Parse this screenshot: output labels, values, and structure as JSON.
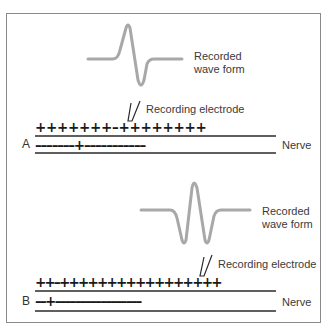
{
  "panels": [
    {
      "id": "A",
      "label": "A",
      "waveform_label_line1": "Recorded",
      "waveform_label_line2": "wave form",
      "electrode_label": "Recording electrode",
      "nerve_label": "Nerve",
      "outer_charges": "+++++++–++++++++",
      "inner_charges": "–––––––+–––––––––––",
      "waveform_type": "biphasic"
    },
    {
      "id": "B",
      "label": "B",
      "waveform_label_line1": "Recorded",
      "waveform_label_line2": "wave form",
      "electrode_label": "Recording electrode",
      "nerve_label": "Nerve",
      "outer_charges": "++–+++++++++++++++++",
      "inner_charges": "––+–––––––––––––––––",
      "waveform_type": "triphasic"
    }
  ],
  "colors": {
    "waveform": "#a8a8a8",
    "lines": "#2a2a2a",
    "frame": "#8a8a8a"
  }
}
